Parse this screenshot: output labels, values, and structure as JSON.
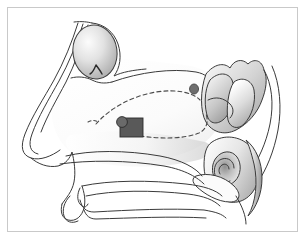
{
  "figure": {
    "title": "Sagittal cross-section of nasal cavity and paranasal sinuses",
    "type": "medical-line-illustration",
    "width": 305,
    "height": 239,
    "background_color": "#ffffff",
    "border_color": "#c9c9c9",
    "border_width": 1,
    "border_inset": 7,
    "outline_color": "#3a3a3a",
    "outline_width": 1,
    "shading_light": "#f2f2f2",
    "shading_mid": "#c8c8c8",
    "shading_dark": "#9a9a9a",
    "marker_fill": "#595959",
    "marker_stroke": "#2b2b2b",
    "dashed_color": "#4a4a4a",
    "dash_pattern": "4 3"
  },
  "structures": [
    {
      "id": "frontal-sinus",
      "label": "Frontal sinus",
      "shading": "radial-gradient",
      "center": [
        95,
        52
      ],
      "radius": [
        22,
        27
      ]
    },
    {
      "id": "nasal-dorsum",
      "label": "Nasal dorsum profile",
      "shading": "none"
    },
    {
      "id": "nasal-septum-body",
      "label": "Nasal septum / cavity body",
      "shading": "soft"
    },
    {
      "id": "middle-turbinate",
      "label": "Middle turbinate region",
      "shading": "gradient"
    },
    {
      "id": "sphenoid-region",
      "label": "Sphenoid sinus / posterior turbinates",
      "shading": "gradient"
    },
    {
      "id": "eustachian-tube",
      "label": "Eustachian tube orifice / torus tubarius",
      "shading": "gradient-spiral"
    },
    {
      "id": "hard-palate",
      "label": "Hard palate",
      "shading": "none"
    },
    {
      "id": "tongue-floor",
      "label": "Tongue and oral floor",
      "shading": "none"
    },
    {
      "id": "nasopharynx",
      "label": "Nasopharynx wall",
      "shading": "gradient"
    }
  ],
  "annotations": {
    "device_marker": {
      "label": "Implant / device marker",
      "shape": "rectangle-with-circle",
      "rect": {
        "x": 120,
        "y": 118,
        "width": 23,
        "height": 19
      },
      "circle": {
        "cx": 122,
        "cy": 122,
        "r": 5
      },
      "fill": "#595959"
    },
    "dashed_path": {
      "label": "Surgical access pathway",
      "style": "dashed",
      "color": "#4a4a4a"
    },
    "sinus_ostium_mark": {
      "label": "Frontal sinus ostium indicator",
      "style": "solid-hook",
      "color": "#2b2b2b"
    }
  },
  "legend": {
    "visible": false,
    "entries": []
  },
  "text_labels": []
}
